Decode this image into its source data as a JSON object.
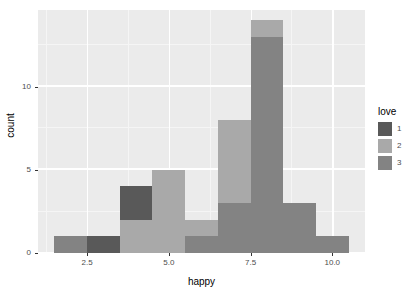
{
  "chart_data": {
    "type": "bar",
    "title": "",
    "xlabel": "happy",
    "ylabel": "count",
    "stacked": true,
    "grid": true,
    "legend_position": "right",
    "legend_title": "love",
    "xlim": [
      1.0,
      11.0
    ],
    "ylim": [
      0,
      14.6
    ],
    "xticks": [
      2.5,
      5.0,
      7.5,
      10.0
    ],
    "xtick_labels": [
      "2.5",
      "5.0",
      "7.5",
      "10.0"
    ],
    "yticks": [
      0,
      5,
      10
    ],
    "ytick_labels": [
      "0",
      "5",
      "10"
    ],
    "x_minor_ticks": [
      1.25,
      3.75,
      6.25,
      8.75
    ],
    "y_minor_ticks": [
      2.5,
      7.5,
      12.5
    ],
    "bin_width": 1.0,
    "bin_centers": [
      2.0,
      3.0,
      4.0,
      5.0,
      6.0,
      7.0,
      8.0,
      9.0,
      10.0
    ],
    "categories": [
      "1.5-2.5",
      "2.5-3.5",
      "3.5-4.5",
      "4.5-5.5",
      "5.5-6.5",
      "6.5-7.5",
      "7.5-8.5",
      "8.5-9.5",
      "9.5-10.5"
    ],
    "series": [
      {
        "name": "1",
        "color": "#595959",
        "values": [
          0,
          1,
          2,
          0,
          0,
          0,
          0,
          0,
          0
        ]
      },
      {
        "name": "2",
        "color": "#a9a9a9",
        "values": [
          0,
          0,
          2,
          5,
          1,
          5,
          1,
          0,
          0
        ]
      },
      {
        "name": "3",
        "color": "#838383",
        "values": [
          1,
          0,
          0,
          0,
          1,
          3,
          13,
          3,
          1
        ]
      }
    ],
    "totals": [
      1,
      1,
      4,
      5,
      2,
      8,
      14,
      3,
      1
    ],
    "panel_background": "#ebebeb",
    "grid_major_color": "#ffffff",
    "grid_minor_color": "#f5f5f5",
    "text_color": "#4d4d4d"
  },
  "legend": {
    "title": "love",
    "items": [
      {
        "label": "1",
        "color": "#595959"
      },
      {
        "label": "2",
        "color": "#a9a9a9"
      },
      {
        "label": "3",
        "color": "#838383"
      }
    ]
  },
  "axes": {
    "x_title": "happy",
    "y_title": "count",
    "x_tick_labels": [
      "2.5",
      "5.0",
      "7.5",
      "10.0"
    ],
    "y_tick_labels": [
      "0",
      "5",
      "10"
    ]
  }
}
